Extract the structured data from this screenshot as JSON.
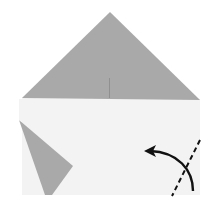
{
  "diagram": {
    "type": "origami-fold-step",
    "colors": {
      "paper_colored": "#a9a9a9",
      "paper_white": "#f3f3f3",
      "background": "#ffffff",
      "line": "#111111"
    },
    "elements": [
      {
        "name": "top-triangle",
        "kind": "colored-side"
      },
      {
        "name": "white-rectangle",
        "kind": "white-side"
      },
      {
        "name": "left-flap",
        "kind": "colored-side"
      },
      {
        "name": "center-crease",
        "kind": "crease"
      },
      {
        "name": "valley-fold-line",
        "kind": "dashed-line"
      },
      {
        "name": "fold-arrow",
        "kind": "curved-arrow",
        "direction": "left"
      }
    ]
  }
}
